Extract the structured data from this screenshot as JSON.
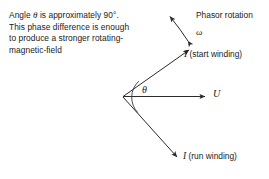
{
  "figure": {
    "note": {
      "prefix": "Angle ",
      "symbol": "θ",
      "body": " is approximately 90°. This phase difference is enough to produce a stronger rotating-magnetic-field"
    },
    "labels": {
      "phasor_rotation": "Phasor rotation",
      "omega": "ω",
      "theta": "θ",
      "voltage": "U",
      "current_symbol": "I",
      "start_winding": "(start winding)",
      "run_winding": "(run winding)"
    },
    "colors": {
      "background": "#ffffff",
      "ink": "#1a1a1a",
      "line": "#2b2b2b"
    },
    "geometry": {
      "vertex": [
        123,
        97
      ],
      "voltage_tip": [
        207,
        96
      ],
      "start_winding_tip": [
        190,
        49
      ],
      "run_winding_tip": [
        178,
        158
      ],
      "rotation_arc_start": [
        189,
        42
      ],
      "rotation_arc_end": [
        167,
        14
      ],
      "angle_arc_radius": 22
    }
  }
}
